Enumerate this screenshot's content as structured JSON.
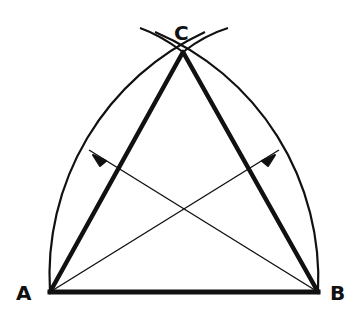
{
  "diagram": {
    "title": "",
    "type": "geometric-construction",
    "colors": {
      "ink": "#111111",
      "background": "#ffffff"
    },
    "points": {
      "A": {
        "label": "A",
        "x": 50,
        "y": 292
      },
      "B": {
        "label": "B",
        "x": 318,
        "y": 292
      },
      "C": {
        "label": "C",
        "x": 183,
        "y": 52
      }
    },
    "segments": [
      {
        "from": "A",
        "to": "B",
        "weight": "thick"
      },
      {
        "from": "A",
        "to": "C",
        "weight": "thick"
      },
      {
        "from": "B",
        "to": "C",
        "weight": "thick"
      },
      {
        "from": "A",
        "to": "mid-BC",
        "weight": "thin"
      },
      {
        "from": "B",
        "to": "mid-AC",
        "weight": "thin"
      }
    ],
    "arcs": [
      {
        "center": "B",
        "radius_through": "A",
        "side": "left"
      },
      {
        "center": "A",
        "radius_through": "B",
        "side": "right"
      }
    ],
    "arrows": [
      {
        "at": "left-arc",
        "direction": "up-left"
      },
      {
        "at": "right-arc",
        "direction": "up-right"
      }
    ]
  }
}
